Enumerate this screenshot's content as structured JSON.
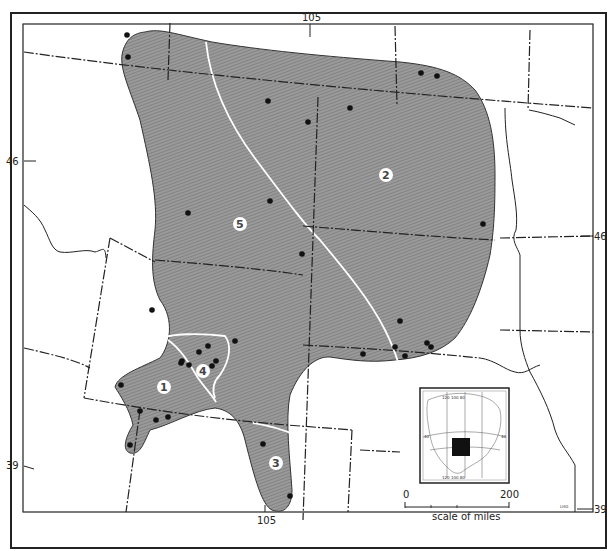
{
  "figure": {
    "type": "distribution map",
    "corner_note": "",
    "fill_color": "#8f8f8f",
    "hatch_color": "#6e6e6e",
    "boundary_color": "#ffffff",
    "locality_dot_color": "#111111",
    "credit_initials": "LHG"
  },
  "graticule": {
    "top_longitude": "105",
    "bottom_longitude": "105",
    "left_lat_upper": "46",
    "left_lat_lower": "39",
    "right_lat_upper": "46",
    "right_lat_lower": "39"
  },
  "regions": [
    {
      "id": "1",
      "label": "1"
    },
    {
      "id": "2",
      "label": "2"
    },
    {
      "id": "3",
      "label": "3"
    },
    {
      "id": "4",
      "label": "4"
    },
    {
      "id": "5",
      "label": "5"
    }
  ],
  "scale_bar": {
    "start_label": "0",
    "end_label": "200",
    "caption": "scale of miles"
  },
  "inset": {
    "description": "North America locator map with shaded square marking study area",
    "top_labels": "120 100 80",
    "bottom_labels": "120 100 80",
    "left_label": "40",
    "right_label": "40"
  },
  "localities": [
    [
      127,
      35
    ],
    [
      128,
      57
    ],
    [
      421,
      73
    ],
    [
      437,
      76
    ],
    [
      268,
      101
    ],
    [
      350,
      108
    ],
    [
      308,
      122
    ],
    [
      188,
      213
    ],
    [
      270,
      201
    ],
    [
      302,
      254
    ],
    [
      483,
      224
    ],
    [
      152,
      310
    ],
    [
      235,
      341
    ],
    [
      400,
      321
    ],
    [
      208,
      346
    ],
    [
      199,
      352
    ],
    [
      216,
      361
    ],
    [
      212,
      366
    ],
    [
      181,
      363
    ],
    [
      189,
      365
    ],
    [
      182,
      361
    ],
    [
      121,
      385
    ],
    [
      140,
      411
    ],
    [
      156,
      420
    ],
    [
      168,
      417
    ],
    [
      130,
      445
    ],
    [
      263,
      444
    ],
    [
      290,
      496
    ],
    [
      363,
      354
    ],
    [
      395,
      347
    ],
    [
      405,
      356
    ],
    [
      427,
      343
    ],
    [
      431,
      347
    ]
  ]
}
